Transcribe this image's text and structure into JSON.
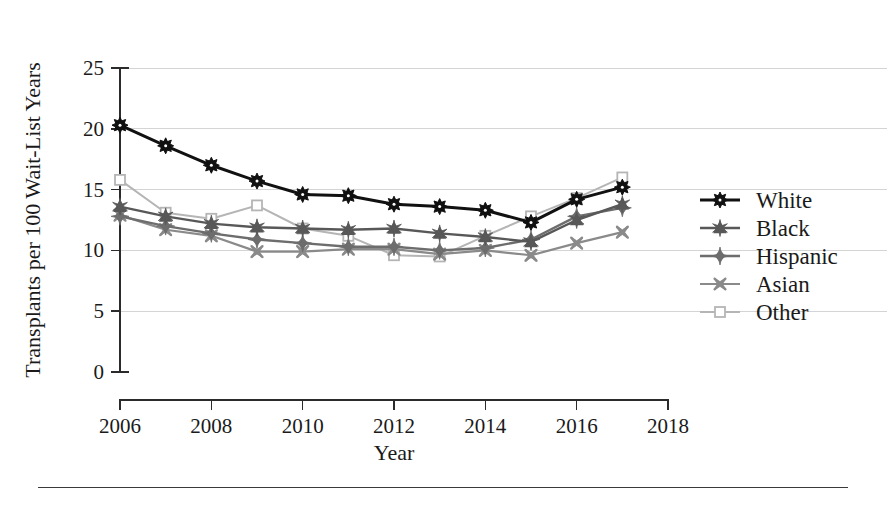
{
  "figure": {
    "background_color": "#ffffff",
    "footer_rule": true
  },
  "chart_data": {
    "type": "line",
    "title": "",
    "xlabel": "Year",
    "ylabel": "Transplants per 100 Wait-List Years",
    "x": [
      2006,
      2007,
      2008,
      2009,
      2010,
      2011,
      2012,
      2013,
      2014,
      2015,
      2016,
      2017
    ],
    "xlim": [
      2006,
      2018
    ],
    "ylim": [
      0,
      25
    ],
    "xticks": [
      2006,
      2008,
      2010,
      2012,
      2014,
      2016,
      2018
    ],
    "xtick_labels": [
      "2006",
      "2008",
      "2010",
      "2012",
      "2014",
      "2016",
      "2018"
    ],
    "yticks": [
      0,
      5,
      10,
      15,
      20,
      25
    ],
    "ytick_labels": [
      "0",
      "5",
      "10",
      "15",
      "20",
      "25"
    ],
    "grid": true,
    "grid_axis": "y",
    "legend_position": "right",
    "series": [
      {
        "name": "White",
        "color": "#111111",
        "marker": "circle-star",
        "line_width": 3.0,
        "values": [
          20.3,
          18.6,
          17.0,
          15.7,
          14.6,
          14.5,
          13.8,
          13.6,
          13.3,
          12.3,
          14.2,
          15.2
        ]
      },
      {
        "name": "Black",
        "color": "#585858",
        "marker": "triangle",
        "line_width": 2.4,
        "values": [
          13.6,
          12.8,
          12.2,
          11.9,
          11.8,
          11.7,
          11.8,
          11.4,
          11.1,
          10.7,
          12.5,
          13.8
        ]
      },
      {
        "name": "Hispanic",
        "color": "#6d6d6d",
        "marker": "diamond",
        "line_width": 2.4,
        "values": [
          12.8,
          12.0,
          11.4,
          10.9,
          10.6,
          10.3,
          10.3,
          10.0,
          10.2,
          10.9,
          12.8,
          13.5
        ]
      },
      {
        "name": "Asian",
        "color": "#8a8a8a",
        "marker": "x-star",
        "line_width": 2.2,
        "values": [
          12.9,
          11.7,
          11.2,
          9.9,
          9.9,
          10.1,
          10.1,
          9.7,
          10.0,
          9.6,
          10.6,
          11.5
        ]
      },
      {
        "name": "Other",
        "color": "#b5b5b5",
        "marker": "open-square",
        "line_width": 2.0,
        "values": [
          15.8,
          13.1,
          12.6,
          13.7,
          11.8,
          11.2,
          9.6,
          9.5,
          11.2,
          12.8,
          14.3,
          16.0
        ]
      }
    ]
  },
  "legend": {
    "entries": [
      {
        "label": "White"
      },
      {
        "label": "Black"
      },
      {
        "label": "Hispanic"
      },
      {
        "label": "Asian"
      },
      {
        "label": "Other"
      }
    ]
  }
}
